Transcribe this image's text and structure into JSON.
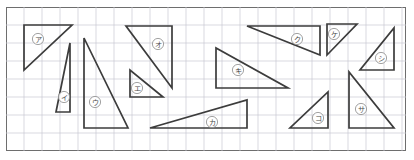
{
  "worksheet": {
    "title": "Right triangle area worksheet",
    "canvas": {
      "width": 414,
      "height": 160
    },
    "frame": {
      "x": 6,
      "y": 7,
      "width": 400,
      "height": 144,
      "stroke": "#6e6e6e"
    },
    "background": "#ffffff",
    "grid": {
      "visible": true,
      "cell_size": 18,
      "origin_x": 6,
      "origin_y": 7,
      "color": "#c8c8d2",
      "line_width": 0.7
    },
    "shape_style": {
      "stroke": "#3c3c3c",
      "line_width": 1.7,
      "fill": "none"
    },
    "label_style": {
      "circle_radius": 5.6,
      "circle_stroke": "#8a8a8a",
      "text_color": "#4a4a4a",
      "font_size": "7.2px"
    },
    "shapes": [
      {
        "id": "triangle-a",
        "label": "ア",
        "points": "24,25 72,25 24,70",
        "label_x": 38,
        "label_y": 39
      },
      {
        "id": "triangle-i",
        "label": "イ",
        "points": "70,43 70,112 56,112",
        "label_x": 64,
        "label_y": 97
      },
      {
        "id": "triangle-u",
        "label": "ウ",
        "points": "84,38 84,128 128,128",
        "label_x": 95,
        "label_y": 102
      },
      {
        "id": "triangle-e",
        "label": "エ",
        "points": "130,70 130,97 163,97",
        "label_x": 137,
        "label_y": 88
      },
      {
        "id": "triangle-o",
        "label": "オ",
        "points": "126,26 172,26 172,88",
        "label_x": 158,
        "label_y": 44
      },
      {
        "id": "triangle-ka",
        "label": "カ",
        "points": "150,128 247,128 247,100",
        "label_x": 212,
        "label_y": 122
      },
      {
        "id": "triangle-ki",
        "label": "キ",
        "points": "216,48 216,88 288,88",
        "label_x": 238,
        "label_y": 70
      },
      {
        "id": "triangle-ku",
        "label": "ク",
        "points": "247,26 320,26 320,55",
        "label_x": 297,
        "label_y": 39
      },
      {
        "id": "triangle-ke",
        "label": "ケ",
        "points": "327,24 357,24 327,55",
        "label_x": 334,
        "label_y": 34
      },
      {
        "id": "triangle-ko",
        "label": "コ",
        "points": "290,128 328,128 328,92",
        "label_x": 318,
        "label_y": 118
      },
      {
        "id": "triangle-sa",
        "label": "サ",
        "points": "349,72 349,128 394,128",
        "label_x": 361,
        "label_y": 109
      },
      {
        "id": "triangle-shi",
        "label": "シ",
        "points": "394,28 394,70 360,70",
        "label_x": 381,
        "label_y": 58
      }
    ]
  }
}
